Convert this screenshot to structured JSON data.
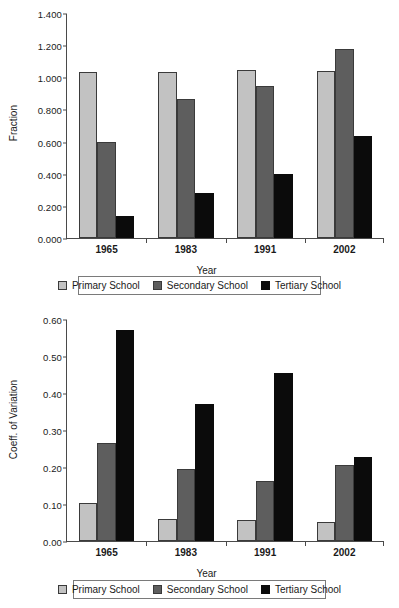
{
  "colors": {
    "primary_school": "#c2c2c2",
    "secondary_school": "#5e5e5e",
    "tertiary_school": "#0b0b0b",
    "axis": "#4a4a4a",
    "background": "#ffffff"
  },
  "legend": {
    "items": [
      {
        "label": "Primary School",
        "swatch": "primary-school-swatch"
      },
      {
        "label": "Secondary School",
        "swatch": "secondary-school-swatch"
      },
      {
        "label": "Tertiary School",
        "swatch": "tertiary-school-swatch"
      }
    ]
  },
  "chart_data": [
    {
      "id": "fraction-chart",
      "type": "bar",
      "title": "",
      "xlabel": "Year",
      "ylabel": "Fraction",
      "categories": [
        "1965",
        "1983",
        "1991",
        "2002"
      ],
      "ylim": [
        0,
        1.4
      ],
      "yticks": [
        "0.000",
        "0.200",
        "0.400",
        "0.600",
        "0.800",
        "1.000",
        "1.200",
        "1.400"
      ],
      "ytick_values": [
        0,
        0.2,
        0.4,
        0.6,
        0.8,
        1.0,
        1.2,
        1.4
      ],
      "grid": false,
      "legend_position": "bottom",
      "series": [
        {
          "name": "Primary School",
          "values": [
            1.03,
            1.03,
            1.045,
            1.04
          ]
        },
        {
          "name": "Secondary School",
          "values": [
            0.6,
            0.865,
            0.947,
            1.178
          ]
        },
        {
          "name": "Tertiary School",
          "values": [
            0.138,
            0.28,
            0.4,
            0.637
          ]
        }
      ]
    },
    {
      "id": "coeff-variation-chart",
      "type": "bar",
      "title": "",
      "xlabel": "Year",
      "ylabel": "Coeff. of Variation",
      "categories": [
        "1965",
        "1983",
        "1991",
        "2002"
      ],
      "ylim": [
        0,
        0.6
      ],
      "yticks": [
        "0.00",
        "0.10",
        "0.20",
        "0.30",
        "0.40",
        "0.50",
        "0.60"
      ],
      "ytick_values": [
        0,
        0.1,
        0.2,
        0.3,
        0.4,
        0.5,
        0.6
      ],
      "grid": false,
      "legend_position": "bottom",
      "series": [
        {
          "name": "Primary School",
          "values": [
            0.102,
            0.059,
            0.058,
            0.051
          ]
        },
        {
          "name": "Secondary School",
          "values": [
            0.266,
            0.195,
            0.162,
            0.205
          ]
        },
        {
          "name": "Tertiary School",
          "values": [
            0.571,
            0.371,
            0.453,
            0.228
          ]
        }
      ]
    }
  ]
}
